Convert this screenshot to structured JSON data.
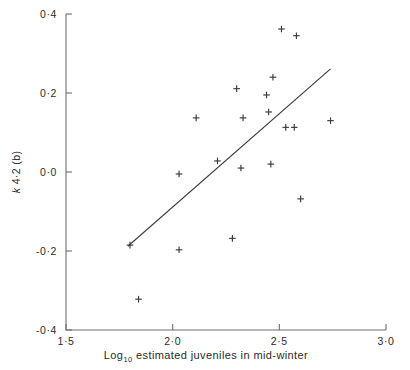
{
  "chart_data": {
    "type": "scatter",
    "title": "",
    "subtitle": "",
    "xlabel": "Log₁₀ estimated juveniles in mid-winter",
    "ylabel": "k 4·2 (b)",
    "xlim": [
      1.5,
      3.0
    ],
    "ylim": [
      -0.4,
      0.4
    ],
    "grid": false,
    "legend": null,
    "x_ticks": [
      1.5,
      2.0,
      2.5,
      3.0
    ],
    "y_ticks": [
      0.4,
      0.2,
      0.0,
      -0.2,
      -0.4
    ],
    "x_tick_labels": [
      "1·5",
      "2·0",
      "2·5",
      "3·0"
    ],
    "y_tick_labels": [
      "0·4",
      "0·2",
      "0·0",
      "-0·2",
      "-0·4"
    ],
    "marker": "plus",
    "marker_color": "#3a3a3a",
    "axis_color": "#6e6e6e",
    "points": [
      {
        "x": 1.8,
        "y": -0.185
      },
      {
        "x": 1.84,
        "y": -0.322
      },
      {
        "x": 2.03,
        "y": -0.005
      },
      {
        "x": 2.03,
        "y": -0.197
      },
      {
        "x": 2.11,
        "y": 0.137
      },
      {
        "x": 2.21,
        "y": 0.028
      },
      {
        "x": 2.28,
        "y": -0.168
      },
      {
        "x": 2.3,
        "y": 0.211
      },
      {
        "x": 2.32,
        "y": 0.01
      },
      {
        "x": 2.33,
        "y": 0.137
      },
      {
        "x": 2.44,
        "y": 0.195
      },
      {
        "x": 2.45,
        "y": 0.152
      },
      {
        "x": 2.46,
        "y": 0.02
      },
      {
        "x": 2.47,
        "y": 0.24
      },
      {
        "x": 2.51,
        "y": 0.362
      },
      {
        "x": 2.53,
        "y": 0.113
      },
      {
        "x": 2.57,
        "y": 0.113
      },
      {
        "x": 2.58,
        "y": 0.345
      },
      {
        "x": 2.6,
        "y": -0.068
      },
      {
        "x": 2.74,
        "y": 0.13
      }
    ],
    "fit_line": {
      "label": "regression-line",
      "x1": 1.79,
      "y1": -0.188,
      "x2": 2.74,
      "y2": 0.261
    }
  },
  "axes": {
    "x_axis_name": "x-axis",
    "y_axis_name": "y-axis"
  }
}
